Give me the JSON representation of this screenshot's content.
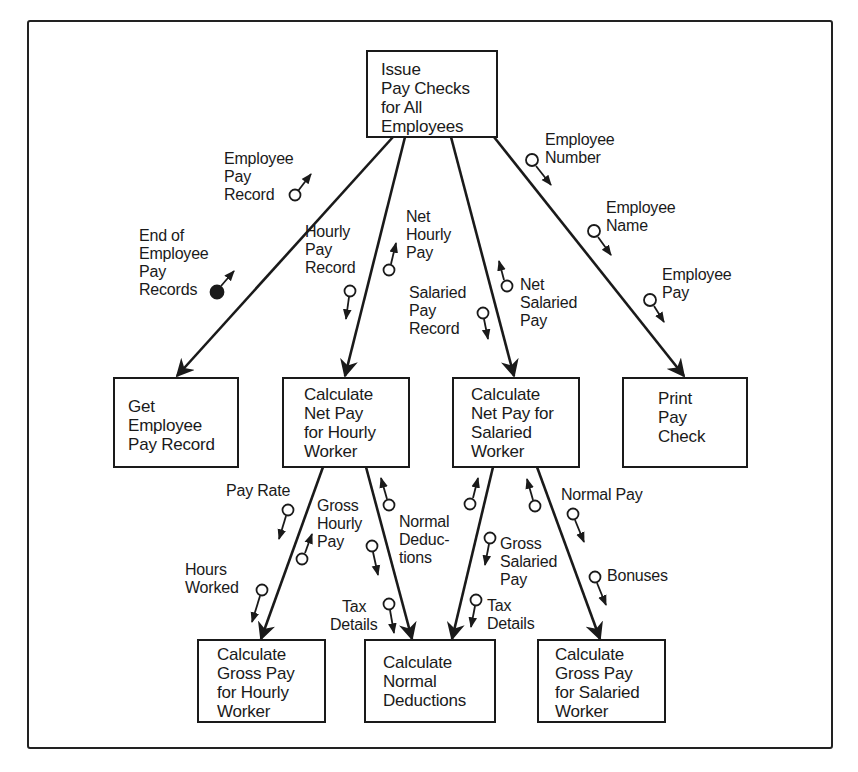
{
  "diagram": {
    "type": "structure-chart",
    "modules": {
      "root": {
        "lines": [
          "Issue",
          "Pay Checks",
          "for All",
          "Employees"
        ]
      },
      "get_record": {
        "lines": [
          "Get",
          "Employee",
          "Pay Record"
        ]
      },
      "net_hourly": {
        "lines": [
          "Calculate",
          "Net Pay",
          "for Hourly",
          "Worker"
        ]
      },
      "net_salaried": {
        "lines": [
          "Calculate",
          "Net Pay for",
          "Salaried",
          "Worker"
        ]
      },
      "print_check": {
        "lines": [
          "Print",
          "Pay",
          "Check"
        ]
      },
      "gross_hourly": {
        "lines": [
          "Calculate",
          "Gross Pay",
          "for Hourly",
          "Worker"
        ]
      },
      "normal_deductions": {
        "lines": [
          "Calculate",
          "Normal",
          "Deductions"
        ]
      },
      "gross_salaried": {
        "lines": [
          "Calculate",
          "Gross Pay",
          "for Salaried",
          "Worker"
        ]
      }
    },
    "couples": {
      "employee_pay_record": {
        "lines": [
          "Employee",
          "Pay",
          "Record"
        ],
        "kind": "data",
        "direction": "up"
      },
      "end_of_records": {
        "lines": [
          "End of",
          "Employee",
          "Pay",
          "Records"
        ],
        "kind": "control",
        "direction": "up"
      },
      "hourly_pay_record": {
        "lines": [
          "Hourly",
          "Pay",
          "Record"
        ],
        "kind": "data",
        "direction": "down"
      },
      "net_hourly_pay": {
        "lines": [
          "Net",
          "Hourly",
          "Pay"
        ],
        "kind": "data",
        "direction": "up"
      },
      "salaried_pay_record": {
        "lines": [
          "Salaried",
          "Pay",
          "Record"
        ],
        "kind": "data",
        "direction": "down"
      },
      "net_salaried_pay": {
        "lines": [
          "Net",
          "Salaried",
          "Pay"
        ],
        "kind": "data",
        "direction": "up"
      },
      "employee_number": {
        "lines": [
          "Employee",
          "Number"
        ],
        "kind": "data",
        "direction": "down"
      },
      "employee_name": {
        "lines": [
          "Employee",
          "Name"
        ],
        "kind": "data",
        "direction": "down"
      },
      "employee_pay": {
        "lines": [
          "Employee",
          "Pay"
        ],
        "kind": "data",
        "direction": "down"
      },
      "pay_rate": {
        "lines": [
          "Pay Rate"
        ],
        "kind": "data",
        "direction": "down"
      },
      "hours_worked": {
        "lines": [
          "Hours",
          "Worked"
        ],
        "kind": "data",
        "direction": "down"
      },
      "gross_hourly_pay": {
        "lines": [
          "Gross",
          "Hourly",
          "Pay"
        ],
        "kind": "data",
        "direction": "up"
      },
      "normal_deductions_h": {
        "lines": [
          "Normal",
          "Deduc-",
          "tions"
        ],
        "kind": "data",
        "direction": "up"
      },
      "tax_details_h": {
        "lines": [
          "Tax",
          "Details"
        ],
        "kind": "data",
        "direction": "down"
      },
      "gross_salaried_pay": {
        "lines": [
          "Gross",
          "Salaried",
          "Pay"
        ],
        "kind": "data",
        "direction": "down"
      },
      "tax_details_s": {
        "lines": [
          "Tax",
          "Details"
        ],
        "kind": "data",
        "direction": "down"
      },
      "normal_pay": {
        "lines": [
          "Normal Pay"
        ],
        "kind": "data",
        "direction": "down"
      },
      "bonuses": {
        "lines": [
          "Bonuses"
        ],
        "kind": "data",
        "direction": "down"
      }
    },
    "colors": {
      "ink": "#1a1a1a",
      "background": "#ffffff"
    }
  }
}
